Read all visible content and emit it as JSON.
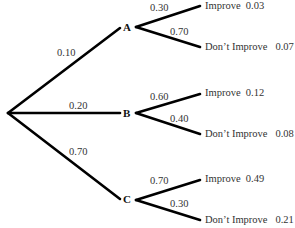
{
  "tree": {
    "root_branches": [
      {
        "node": "A",
        "prob": "0.10",
        "outcomes": [
          {
            "label": "Improve",
            "branch_prob": "0.30",
            "joint": "0.03"
          },
          {
            "label": "Don’t Improve",
            "branch_prob": "0.70",
            "joint": "0.07"
          }
        ]
      },
      {
        "node": "B",
        "prob": "0.20",
        "outcomes": [
          {
            "label": "Improve",
            "branch_prob": "0.60",
            "joint": "0.12"
          },
          {
            "label": "Don’t Improve",
            "branch_prob": "0.40",
            "joint": "0.08"
          }
        ]
      },
      {
        "node": "C",
        "prob": "0.70",
        "outcomes": [
          {
            "label": "Improve",
            "branch_prob": "0.70",
            "joint": "0.49"
          },
          {
            "label": "Don’t Improve",
            "branch_prob": "0.30",
            "joint": "0.21"
          }
        ]
      }
    ]
  }
}
